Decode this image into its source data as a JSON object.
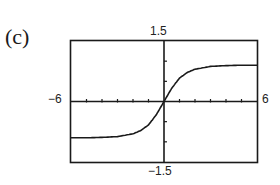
{
  "panel_label": "(c)",
  "window": {
    "xmin_label": "−6",
    "xmax_label": "6",
    "ymin_label": "−1.5",
    "ymax_label": "1.5"
  },
  "chart_data": {
    "type": "line",
    "title": "",
    "panel": "(c)",
    "xlabel": "",
    "ylabel": "",
    "xlim": [
      -6,
      6
    ],
    "ylim": [
      -1.5,
      1.5
    ],
    "x_tick_spacing": 1,
    "y_tick_spacing": 0.5,
    "grid": false,
    "legend": null,
    "series": [
      {
        "name": "f(x)",
        "description": "increasing sigmoid through the origin with horizontal asymptotes near y = ±0.9",
        "x": [
          -6,
          -5,
          -4,
          -3,
          -2,
          -1.5,
          -1,
          -0.5,
          0,
          0.5,
          1,
          1.5,
          2,
          3,
          4,
          5,
          6
        ],
        "y": [
          -0.9,
          -0.9,
          -0.89,
          -0.87,
          -0.8,
          -0.72,
          -0.58,
          -0.33,
          0,
          0.33,
          0.58,
          0.72,
          0.8,
          0.87,
          0.89,
          0.9,
          0.9
        ]
      }
    ]
  }
}
